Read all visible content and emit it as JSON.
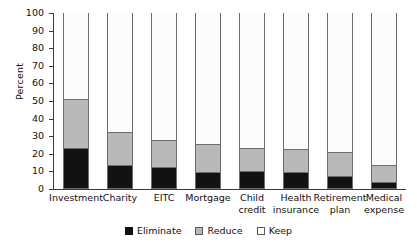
{
  "chart_data": {
    "type": "bar",
    "subtype": "stacked-bar-100",
    "title": "",
    "xlabel": "",
    "ylabel": "Percent",
    "ylim": [
      0,
      100
    ],
    "yticks": [
      0,
      10,
      20,
      30,
      40,
      50,
      60,
      70,
      80,
      90,
      100
    ],
    "grid": false,
    "legend_position": "bottom",
    "categories": [
      "Investment",
      "Charity",
      "EITC",
      "Mortgage",
      "Child credit",
      "Health insurance",
      "Retirement plan",
      "Medical expense"
    ],
    "category_lines": [
      [
        "Investment"
      ],
      [
        "Charity"
      ],
      [
        "EITC"
      ],
      [
        "Mortgage"
      ],
      [
        "Child",
        "credit"
      ],
      [
        "Health",
        "insurance"
      ],
      [
        "Retirement",
        "plan"
      ],
      [
        "Medical",
        "expense"
      ]
    ],
    "series": [
      {
        "name": "Eliminate",
        "color": "#121212",
        "values": [
          22.2,
          12.5,
          11.4,
          8.5,
          9.0,
          8.5,
          6.3,
          2.8
        ]
      },
      {
        "name": "Reduce",
        "color": "#b9b9b9",
        "values": [
          28.6,
          19.3,
          15.9,
          16.5,
          13.7,
          13.7,
          14.2,
          10.2
        ]
      },
      {
        "name": "Keep",
        "color": "#ffffff",
        "values": [
          49.2,
          68.2,
          72.7,
          75.0,
          77.3,
          77.8,
          79.5,
          87.0
        ]
      }
    ],
    "cumulative_tops": {
      "eliminate": [
        22.2,
        12.5,
        11.4,
        8.5,
        9.0,
        8.5,
        6.3,
        2.8
      ],
      "reduce": [
        50.8,
        31.8,
        27.3,
        25.0,
        22.7,
        22.2,
        20.5,
        13.0
      ],
      "keep": [
        100,
        100,
        100,
        100,
        100,
        100,
        100,
        100
      ]
    }
  },
  "legend": {
    "items": [
      {
        "label": "Eliminate",
        "swatch": "eliminate-swatch"
      },
      {
        "label": "Reduce",
        "swatch": "reduce-swatch"
      },
      {
        "label": "Keep",
        "swatch": "keep-swatch"
      }
    ]
  },
  "axis": {
    "y_title": "Percent",
    "y_tick_labels": [
      "100",
      "90",
      "80",
      "70",
      "60",
      "50",
      "40",
      "30",
      "20",
      "10",
      "0"
    ]
  }
}
